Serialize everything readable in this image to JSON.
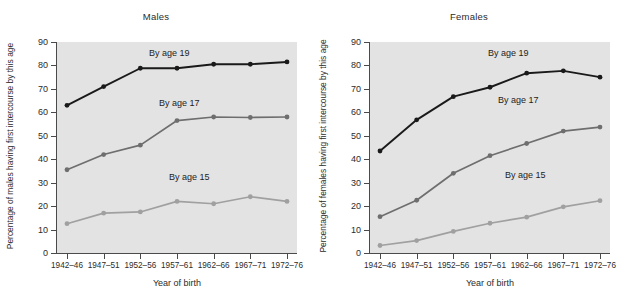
{
  "figure": {
    "background": "#ffffff",
    "plot_background": "#e3e3e3"
  },
  "colors": {
    "age19": "#1a1a1a",
    "age17": "#6e6e6e",
    "age15": "#a0a0a0",
    "axis": "#4a4a4a",
    "text": "#2b2b2b"
  },
  "panels": [
    {
      "id": "males",
      "title": "Males",
      "ylabel": "Percentage of males having first intercourse by this age",
      "xlabel": "Year of birth",
      "annotations": [
        {
          "label": "By age 19"
        },
        {
          "label": "By age 17"
        },
        {
          "label": "By age 15"
        }
      ]
    },
    {
      "id": "females",
      "title": "Females",
      "ylabel": "Percentage of females having first intercourse by this age",
      "xlabel": "Year of birth",
      "annotations": [
        {
          "label": "By age 19"
        },
        {
          "label": "By age 17"
        },
        {
          "label": "By age 15"
        }
      ]
    }
  ],
  "axis": {
    "yticks": [
      0,
      10,
      20,
      30,
      40,
      50,
      60,
      70,
      80,
      90
    ],
    "ylim": [
      0,
      90
    ],
    "xticklabels": [
      "1942–46",
      "1947–51",
      "1952–56",
      "1957–61",
      "1962–66",
      "1967–71",
      "1972–76"
    ]
  },
  "chart_data": [
    {
      "type": "line",
      "title": "Males",
      "xlabel": "Year of birth",
      "ylabel": "Percentage of males having first intercourse by this age",
      "ylim": [
        0,
        90
      ],
      "grid": false,
      "legend": "inline-annotations",
      "categories": [
        "1942–46",
        "1947–51",
        "1952–56",
        "1957–61",
        "1962–66",
        "1967–71",
        "1972–76"
      ],
      "series": [
        {
          "name": "By age 19",
          "color": "#1a1a1a",
          "values": [
            63.0,
            71.0,
            78.8,
            78.8,
            80.5,
            80.5,
            81.5
          ]
        },
        {
          "name": "By age 17",
          "color": "#6e6e6e",
          "values": [
            35.5,
            42.0,
            46.0,
            56.5,
            58.0,
            57.8,
            58.0
          ]
        },
        {
          "name": "By age 15",
          "color": "#a0a0a0",
          "values": [
            12.5,
            17.0,
            17.5,
            22.0,
            21.0,
            24.0,
            22.0
          ]
        }
      ]
    },
    {
      "type": "line",
      "title": "Females",
      "xlabel": "Year of birth",
      "ylabel": "Percentage of females having first intercourse by this age",
      "ylim": [
        0,
        90
      ],
      "grid": false,
      "legend": "inline-annotations",
      "categories": [
        "1942–46",
        "1947–51",
        "1952–56",
        "1957–61",
        "1962–66",
        "1967–71",
        "1972–76"
      ],
      "series": [
        {
          "name": "By age 19",
          "color": "#1a1a1a",
          "values": [
            43.5,
            56.8,
            66.7,
            70.7,
            76.7,
            77.7,
            75.0
          ]
        },
        {
          "name": "By age 17",
          "color": "#6e6e6e",
          "values": [
            15.5,
            22.5,
            34.0,
            41.5,
            46.7,
            52.0,
            53.7
          ]
        },
        {
          "name": "By age 15",
          "color": "#a0a0a0",
          "values": [
            3.2,
            5.3,
            9.2,
            12.7,
            15.3,
            19.7,
            22.3
          ]
        }
      ]
    }
  ]
}
